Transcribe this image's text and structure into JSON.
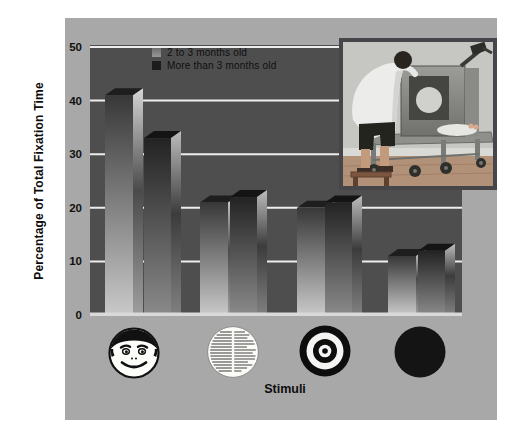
{
  "figure": {
    "y_axis": {
      "title": "Percentage of Total Fixation Time",
      "ticks": [
        "0",
        "10",
        "20",
        "30",
        "40",
        "50"
      ]
    },
    "x_axis": {
      "title": "Stimuli"
    },
    "legend": {
      "items": [
        {
          "label": "2 to 3 months old",
          "swatch_color": "#8f8f8f",
          "swatch_style": "light-gradient"
        },
        {
          "label": "More than 3 months old",
          "swatch_color": "#1c1c1c",
          "swatch_style": "dark"
        }
      ]
    },
    "stimuli_icons": [
      "face-icon",
      "newsprint-icon",
      "bullseye-icon",
      "solid-black-circle-icon"
    ],
    "colors": {
      "panel_bg": "#a8a8a8",
      "plot_bg": "#4e4e4e",
      "gridline": "#ededed",
      "baseline": "#d9d9d9",
      "bar_light_top": "#383838",
      "bar_light_bottom": "#c9c9c9",
      "bar_dark_top": "#232323",
      "bar_dark_bottom": "#8a8a8a"
    }
  },
  "chart_data": {
    "type": "bar",
    "categories": [
      "Face",
      "Newsprint",
      "Bull's-eye",
      "Plain circle"
    ],
    "series": [
      {
        "name": "2 to 3 months old",
        "values": [
          41,
          21,
          20,
          11
        ]
      },
      {
        "name": "More than 3 months old",
        "values": [
          33,
          22,
          21,
          12
        ]
      }
    ],
    "xlabel": "Stimuli",
    "ylabel": "Percentage of Total Fixation Time",
    "ylim": [
      0,
      50
    ],
    "yticks": [
      0,
      10,
      20,
      30,
      40,
      50
    ],
    "grid": true,
    "legend_position": "top inside plot",
    "style": "3D gray gradient slabs on dark plot"
  },
  "photo_inset": {
    "description": "Researcher leaning over an infant lying in a looking-chamber apparatus on a wheeled cart"
  }
}
